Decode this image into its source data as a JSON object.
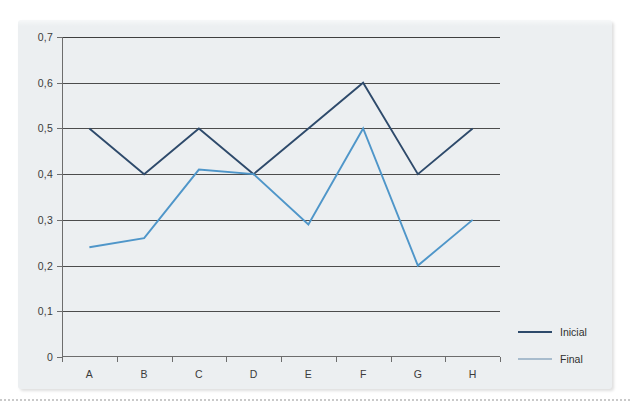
{
  "chart_data": {
    "type": "line",
    "title": "",
    "xlabel": "",
    "ylabel": "",
    "categories": [
      "A",
      "B",
      "C",
      "D",
      "E",
      "F",
      "G",
      "H"
    ],
    "series": [
      {
        "name": "Inicial",
        "color": "#2e4a6b",
        "values": [
          0.5,
          0.4,
          0.5,
          0.4,
          0.5,
          0.6,
          0.4,
          0.5
        ]
      },
      {
        "name": "Final",
        "color": "#4f96c9",
        "values": [
          0.24,
          0.26,
          0.41,
          0.4,
          0.29,
          0.5,
          0.2,
          0.3
        ]
      }
    ],
    "ylim": [
      0,
      0.7
    ],
    "y_ticks": [
      0,
      0.1,
      0.2,
      0.3,
      0.4,
      0.5,
      0.6,
      0.7
    ],
    "y_tick_labels": [
      "0",
      "0,1",
      "0,2",
      "0,3",
      "0,4",
      "0,5",
      "0,6",
      "0,7"
    ],
    "grid": "horizontal",
    "legend_position": "bottom-right",
    "decimal_separator": ","
  },
  "legend": {
    "items": [
      {
        "label": "Inicial",
        "color": "#2e4a6b"
      },
      {
        "label": "Final",
        "color": "#a8bccd"
      }
    ]
  },
  "colors": {
    "card_background": "#eceff1",
    "page_background": "#ffffff",
    "gridline": "#4c4c4c",
    "axis": "#6d6d6d",
    "tick_text": "#3b3b3b",
    "series_inicial": "#2e4a6b",
    "series_final": "#4f96c9",
    "dotted_rule": "#c9c9c9"
  }
}
